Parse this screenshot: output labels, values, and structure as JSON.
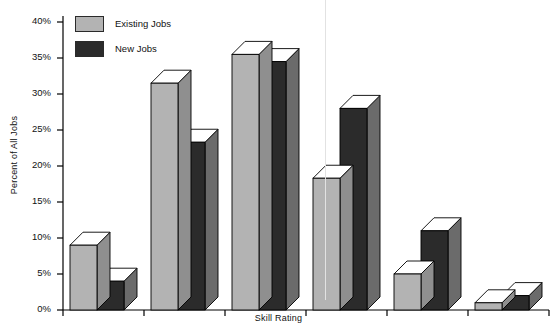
{
  "chart_data": {
    "type": "bar",
    "title": "",
    "subtitle": "",
    "xlabel": "Skill Rating",
    "ylabel": "Percent of All Jobs",
    "categories": [
      "0.7–1.4",
      "1.5–2.4",
      "2.5–3.4",
      "3.5–4.4",
      "4.5–5.4",
      "5.5–6.4"
    ],
    "series": [
      {
        "name": "Existing Jobs",
        "color": "#b3b3b3",
        "values": [
          9,
          31.5,
          35.5,
          18.3,
          5,
          1
        ]
      },
      {
        "name": "New Jobs",
        "color": "#2b2b2b",
        "values": [
          4,
          23.3,
          34.5,
          28,
          11,
          2
        ]
      }
    ],
    "ylim": [
      0,
      40
    ],
    "yticks": [
      0,
      5,
      10,
      15,
      20,
      25,
      30,
      35,
      40
    ],
    "ytick_labels": [
      "0%",
      "5%",
      "10%",
      "15%",
      "20%",
      "25%",
      "30%",
      "35%",
      "40%"
    ],
    "grid": false,
    "legend_position": "top-left",
    "style": "3d-bars"
  },
  "legend": {
    "items": [
      {
        "label": "Existing Jobs",
        "color": "#b3b3b3"
      },
      {
        "label": "New Jobs",
        "color": "#2b2b2b"
      }
    ]
  },
  "colors": {
    "existing_face": "#b3b3b3",
    "existing_side": "#8f8f8f",
    "existing_top": "#ffffff",
    "new_face": "#2b2b2b",
    "new_side": "#6b6b6b",
    "new_top": "#ffffff",
    "axis": "#000000",
    "text": "#111111",
    "background": "#ffffff"
  }
}
